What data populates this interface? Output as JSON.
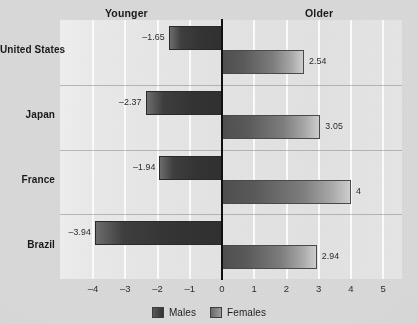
{
  "headers": {
    "left": "Younger",
    "right": "Older"
  },
  "legend": {
    "males": "Males",
    "females": "Females"
  },
  "colors": {
    "male_bar": "#333333",
    "female_bar": "#8a8a8a",
    "plot_background": "#e4e4e4",
    "page_background": "#d9d9d9",
    "zero_line": "#101010",
    "gridline": "#ffffff"
  },
  "chart_data": {
    "type": "bar",
    "orientation": "horizontal",
    "title": "",
    "subtitle": "",
    "xlabel": "",
    "ylabel": "",
    "categories": [
      "United States",
      "Japan",
      "France",
      "Brazil"
    ],
    "series": [
      {
        "name": "Males",
        "values": [
          -1.65,
          -2.37,
          -1.94,
          -3.94
        ],
        "labels": [
          "–1.65",
          "–2.37",
          "–1.94",
          "–3.94"
        ]
      },
      {
        "name": "Females",
        "values": [
          2.54,
          3.05,
          4,
          2.94
        ],
        "labels": [
          "2.54",
          "3.05",
          "4",
          "2.94"
        ]
      }
    ],
    "xlim": [
      -4.75,
      5.6
    ],
    "xticks": [
      -4,
      -3,
      -2,
      -1,
      0,
      1,
      2,
      3,
      4,
      5
    ],
    "xticklabels": [
      "–4",
      "–3",
      "–2",
      "–1",
      "0",
      "1",
      "2",
      "3",
      "4",
      "5"
    ],
    "grid": "vertical",
    "legend_position": "bottom",
    "annotations": [
      "Younger",
      "Older"
    ]
  }
}
